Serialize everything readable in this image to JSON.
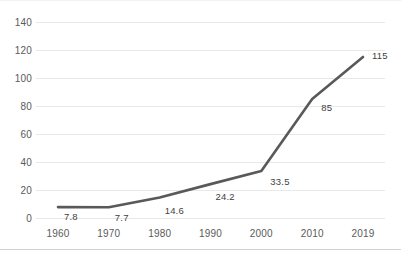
{
  "chart_data": {
    "type": "line",
    "title": "",
    "subtitle": "",
    "xlabel": "",
    "ylabel": "",
    "categories": [
      "1960",
      "1970",
      "1980",
      "1990",
      "2000",
      "2010",
      "2019"
    ],
    "values": [
      7.8,
      7.7,
      14.6,
      24.2,
      33.5,
      85,
      115
    ],
    "point_labels": [
      "7.8",
      "7.7",
      "14.6",
      "24.2",
      "33.5",
      "85",
      "115"
    ],
    "series": [
      {
        "name": "",
        "values": [
          7.8,
          7.7,
          14.6,
          24.2,
          33.5,
          85,
          115
        ]
      }
    ],
    "ylim": [
      0,
      140
    ],
    "yticks": [
      0,
      20,
      40,
      60,
      80,
      100,
      120,
      140
    ],
    "ytick_labels": [
      "0",
      "20",
      "40",
      "60",
      "80",
      "100",
      "120",
      "140"
    ],
    "xtick_labels": [
      "1960",
      "1970",
      "1980",
      "1990",
      "2000",
      "2010",
      "2019"
    ],
    "grid": true,
    "grid_axis": "y",
    "legend": false,
    "legend_position": "none",
    "annotations": [],
    "colors": {
      "line": "#595959",
      "gridline": "#e8e8e8",
      "tick_text": "#5a5a5a",
      "label_text": "#3f3f3f",
      "background": "#ffffff",
      "border": "#d2d2d2"
    }
  }
}
